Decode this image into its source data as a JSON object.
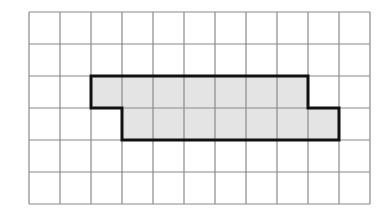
{
  "diagram": {
    "type": "grid-polyomino",
    "grid": {
      "columns": 11,
      "rows": 6,
      "origin_x": 29,
      "origin_y": 12,
      "cell_width": 31,
      "cell_height": 32,
      "line_color": "#8a8a8a",
      "background": "#ffffff"
    },
    "shape": {
      "fill": "#e4e4e4",
      "stroke": "#111111",
      "stroke_width": 3,
      "cells": [
        {
          "row": 2,
          "cols": [
            2,
            3,
            4,
            5,
            6,
            7,
            8
          ]
        },
        {
          "row": 3,
          "cols": [
            3,
            4,
            5,
            6,
            7,
            8,
            9
          ]
        }
      ],
      "outline_grid_points": [
        [
          2,
          2
        ],
        [
          9,
          2
        ],
        [
          9,
          3
        ],
        [
          10,
          3
        ],
        [
          10,
          4
        ],
        [
          3,
          4
        ],
        [
          3,
          3
        ],
        [
          2,
          3
        ]
      ]
    }
  }
}
